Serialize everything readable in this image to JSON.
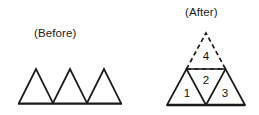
{
  "figure": {
    "stroke_color": "#1a1a1a",
    "background_color": "#ffffff",
    "text_color": "#1b1b1b"
  },
  "before": {
    "caption": "(Before)",
    "description": "Three congruent upward-pointing triangles resting side by side on a common horizontal baseline",
    "triangle_count": 3,
    "baseline": {
      "x1": 18,
      "y1": 103.5,
      "x2": 122,
      "y2": 103.5
    },
    "triangles": [
      {
        "name": "before-triangle-1",
        "apex_x": 36,
        "apex_y": 69,
        "left_x": 19,
        "right_x": 53,
        "base_y": 103
      },
      {
        "name": "before-triangle-2",
        "apex_x": 70,
        "apex_y": 69,
        "left_x": 53,
        "right_x": 87,
        "base_y": 103
      },
      {
        "name": "before-triangle-3",
        "apex_x": 104,
        "apex_y": 69,
        "left_x": 87,
        "right_x": 121,
        "base_y": 103
      }
    ]
  },
  "after": {
    "caption": "(After)",
    "description": "Large triangle subdivided into four smaller triangles; the top triangle is drawn with dashed edges",
    "outer_apex": {
      "x": 206,
      "y": 33
    },
    "baseline": {
      "x1": 167,
      "y1": 105,
      "x2": 245,
      "y2": 105
    },
    "midline": {
      "x1": 186.5,
      "y1": 69,
      "x2": 225.5,
      "y2": 69
    },
    "parts": [
      {
        "id": 1,
        "label": "1",
        "name": "after-triangle-1",
        "orientation": "up",
        "style": "solid",
        "label_x": 187,
        "label_y": 94
      },
      {
        "id": 2,
        "label": "2",
        "name": "after-triangle-2",
        "orientation": "down",
        "style": "solid",
        "label_x": 206,
        "label_y": 81
      },
      {
        "id": 3,
        "label": "3",
        "name": "after-triangle-3",
        "orientation": "up",
        "style": "solid",
        "label_x": 225,
        "label_y": 94
      },
      {
        "id": 4,
        "label": "4",
        "name": "after-triangle-4",
        "orientation": "up",
        "style": "dashed",
        "label_x": 206,
        "label_y": 57
      }
    ]
  }
}
